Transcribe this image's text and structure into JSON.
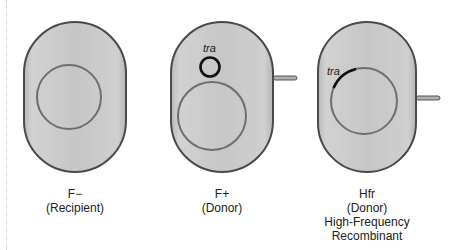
{
  "colors": {
    "cell_fill": "#c4c4c4",
    "cell_stroke": "#4a4a4a",
    "chromosome_stroke": "#6e6e6e",
    "plasmid_stroke": "#111111",
    "background": "#ffffff"
  },
  "cells": [
    {
      "id": "f-minus",
      "type_label": "F−",
      "role_label": "(Recipient)",
      "extra_lines": [],
      "has_pilus": false,
      "has_plasmid": false
    },
    {
      "id": "f-plus",
      "type_label": "F+",
      "role_label": "(Donor)",
      "extra_lines": [],
      "has_pilus": true,
      "has_plasmid": true,
      "plasmid_label": "tra"
    },
    {
      "id": "hfr",
      "type_label": "Hfr",
      "role_label": "(Donor)",
      "extra_lines": [
        "High-Frequency",
        "Recombinant"
      ],
      "has_pilus": true,
      "has_integrated_tra": true,
      "tra_label": "tra"
    }
  ]
}
